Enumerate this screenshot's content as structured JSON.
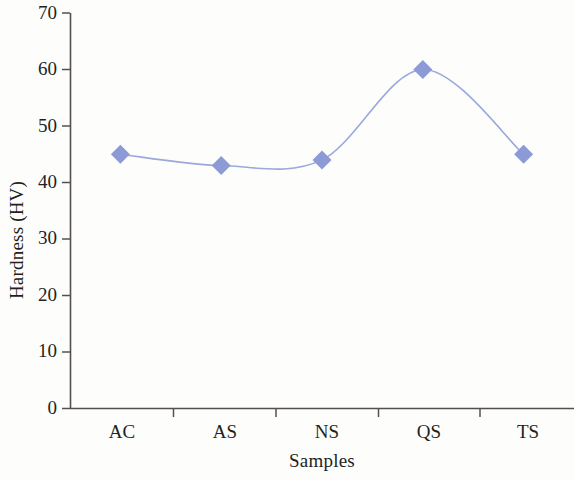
{
  "chart_data": {
    "type": "line",
    "title": "",
    "xlabel": "Samples",
    "ylabel": "Hardness (HV)",
    "categories": [
      "AC",
      "AS",
      "NS",
      "QS",
      "TS"
    ],
    "values": [
      45,
      43,
      44,
      60,
      45
    ],
    "series": [
      {
        "name": "Hardness (HV)",
        "values": [
          45,
          43,
          44,
          60,
          45
        ],
        "marker": "diamond",
        "marker_color": "#8c9bd6",
        "line_color": "#9aa8dc",
        "smooth": true
      }
    ],
    "ylim": [
      0,
      70
    ],
    "yticks": [
      0,
      10,
      20,
      30,
      40,
      50,
      60,
      70
    ],
    "ytick_labels": [
      "0",
      "10",
      "20",
      "30",
      "40",
      "50",
      "60",
      "70"
    ],
    "xtick_labels": [
      "AC",
      "AS",
      "NS",
      "QS",
      "TS"
    ],
    "grid": false,
    "legend": false,
    "axis_color": "#55504e",
    "background": "#fdfdfc"
  }
}
